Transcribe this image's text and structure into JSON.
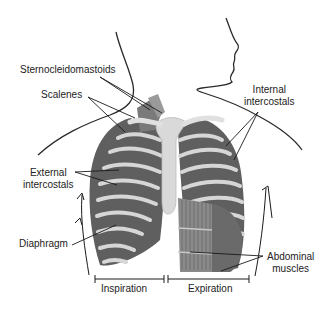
{
  "diagram": {
    "labels": {
      "sternocleidomastoids": "Sternocleidomastoids",
      "scalenes": "Scalenes",
      "internal_intercostals_line1": "Internal",
      "internal_intercostals_line2": "intercostals",
      "external_intercostals_line1": "External",
      "external_intercostals_line2": "intercostals",
      "diaphragm": "Diaphragm",
      "abdominal_muscles_line1": "Abdominal",
      "abdominal_muscles_line2": "muscles"
    },
    "phases": {
      "inspiration": "Inspiration",
      "expiration": "Expiration"
    },
    "colors": {
      "muscle": "#6e6e6e",
      "muscle_dark": "#4a4a4a",
      "bone": "#d9d9d9",
      "outline": "#2a2a2a",
      "text": "#222222"
    }
  }
}
